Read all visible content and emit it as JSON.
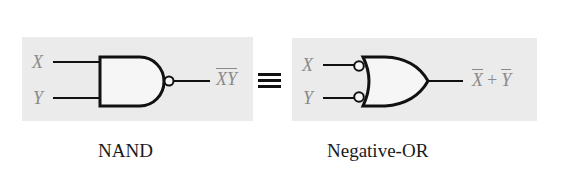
{
  "diagram": {
    "relation_symbol": "≡",
    "gates": [
      {
        "name": "NAND",
        "caption": "NAND",
        "type": "nand",
        "inputs": [
          "X",
          "Y"
        ],
        "inverted_inputs": false,
        "inverted_output": true,
        "output_expression": {
          "overlined": "XY",
          "text": "XY"
        }
      },
      {
        "name": "Negative-OR",
        "caption": "Negative-OR",
        "type": "or",
        "inputs": [
          "X",
          "Y"
        ],
        "inverted_inputs": true,
        "inverted_output": false,
        "output_expression": {
          "term1": "X",
          "operator": "+",
          "term2": "Y"
        }
      }
    ]
  },
  "colors": {
    "panel_background": "#ebebeb",
    "line": "#111111",
    "variable_text": "#8a8a8a",
    "caption_text": "#1a1a1a"
  }
}
